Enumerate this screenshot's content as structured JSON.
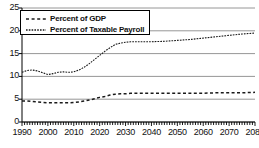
{
  "chart_data": {
    "type": "line",
    "title": "",
    "xlabel": "",
    "ylabel": "",
    "xlim": [
      1990,
      2080
    ],
    "ylim": [
      0,
      25
    ],
    "grid": true,
    "legend_position": "upper-left",
    "y_ticks": [
      0,
      5,
      10,
      15,
      20,
      25
    ],
    "y_tick_labels": [
      "0",
      "5",
      "10",
      "15",
      "20",
      "25"
    ],
    "x_ticks": [
      1990,
      2000,
      2010,
      2020,
      2030,
      2040,
      2050,
      2060,
      2070,
      2080
    ],
    "x_tick_labels": [
      "1990",
      "2000",
      "2010",
      "2020",
      "2030",
      "2040",
      "2050",
      "2060",
      "2070",
      "2080"
    ],
    "x_minor_tick_interval": 1,
    "series": [
      {
        "name": "Percent of Taxable Payroll",
        "style": "dashed-fine",
        "color": "#1a1a1a",
        "x": [
          1990,
          1992,
          1994,
          1996,
          1998,
          2000,
          2002,
          2004,
          2006,
          2008,
          2010,
          2012,
          2014,
          2016,
          2018,
          2020,
          2022,
          2024,
          2026,
          2028,
          2030,
          2032,
          2034,
          2036,
          2038,
          2040,
          2045,
          2050,
          2055,
          2060,
          2065,
          2070,
          2075,
          2080
        ],
        "values": [
          10.9,
          11.3,
          11.4,
          11.2,
          10.8,
          10.4,
          10.6,
          10.9,
          11.0,
          10.9,
          11.0,
          11.4,
          12.0,
          12.8,
          13.7,
          14.6,
          15.5,
          16.3,
          17.0,
          17.3,
          17.5,
          17.6,
          17.6,
          17.6,
          17.6,
          17.6,
          17.7,
          17.9,
          18.1,
          18.4,
          18.7,
          19.0,
          19.3,
          19.5
        ]
      },
      {
        "name": "Percent of GDP",
        "style": "dashed-coarse",
        "color": "#1a1a1a",
        "x": [
          1990,
          1992,
          1994,
          1996,
          1998,
          2000,
          2002,
          2004,
          2006,
          2008,
          2010,
          2012,
          2014,
          2016,
          2018,
          2020,
          2022,
          2024,
          2026,
          2028,
          2030,
          2032,
          2034,
          2036,
          2038,
          2040,
          2045,
          2050,
          2055,
          2060,
          2065,
          2070,
          2075,
          2080
        ],
        "values": [
          4.6,
          4.6,
          4.5,
          4.4,
          4.3,
          4.2,
          4.2,
          4.2,
          4.2,
          4.2,
          4.3,
          4.4,
          4.6,
          4.8,
          5.1,
          5.4,
          5.6,
          5.9,
          6.1,
          6.2,
          6.2,
          6.3,
          6.3,
          6.3,
          6.3,
          6.3,
          6.3,
          6.3,
          6.3,
          6.3,
          6.4,
          6.4,
          6.4,
          6.5
        ]
      }
    ]
  },
  "legend": {
    "items": [
      {
        "label": "Percent of GDP",
        "key": "dashed-coarse-key"
      },
      {
        "label": "Percent of Taxable Payroll",
        "key": "dashed-fine-key"
      }
    ]
  },
  "axes": {
    "y_labels": [
      "25",
      "20",
      "15",
      "10",
      "5",
      "0"
    ],
    "x_labels": [
      "1990",
      "2000",
      "2010",
      "2020",
      "2030",
      "2040",
      "2050",
      "2060",
      "2070",
      "2080"
    ]
  },
  "colors": {
    "line": "#1a1a1a",
    "grid": "#8a8a8a",
    "axis": "#000000",
    "background": "#ffffff"
  }
}
